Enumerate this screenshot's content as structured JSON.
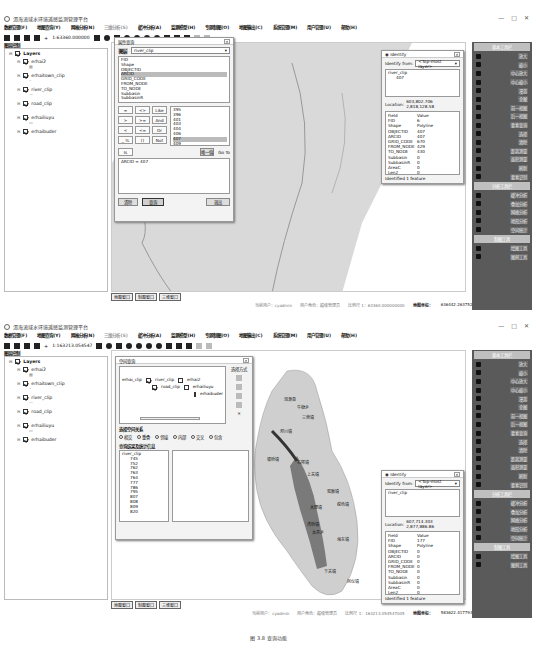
{
  "app_title": "洱海流域水环境遥感监测管理平台",
  "window_controls": [
    "—",
    "□",
    "✕"
  ],
  "menu": [
    "数据管理(F)",
    "地图查询(Y)",
    "网格分析(N)",
    "三维分析(S)",
    "缓冲分析(A)",
    "监测模型(H)",
    "专题制图(O)",
    "地图输出(C)",
    "系统管理(M)",
    "用户管理(U)",
    "帮助(H)"
  ],
  "screens": [
    {
      "scale": "1:63360.000000",
      "layer_panel_title": "图层控制",
      "layers_root": "Layers",
      "layers": [
        "erhai2",
        "erhaitown_clip",
        "river_clip",
        "road_clip",
        "erhailiuyu",
        "erhaibuder"
      ],
      "map_tabs": [
        "地图窗口",
        "制图窗口",
        "三维窗口"
      ],
      "status": {
        "user": "当前用户：cyadmin",
        "role": "用户角色：超级管理员",
        "scale": "比例尺 1：63360.000000000",
        "coord_label": "地图坐标：",
        "x": "636442.26375267",
        "y": "2917443.26105774"
      },
      "query_dialog": {
        "title": "属性查询",
        "layer_label": "图层",
        "layer_value": "river_clip",
        "fields": [
          "FID",
          "Shape",
          "OBJECTID",
          "ARCID",
          "GRID_CODE",
          "FROM_NODE",
          "TO_NODE",
          "Subbasin",
          "SubbasinR"
        ],
        "selected_field": "ARCID",
        "operators": [
          [
            "=",
            "<>",
            "Like"
          ],
          [
            ">",
            ">=",
            "And"
          ],
          [
            "<",
            "<=",
            "Or"
          ],
          [
            "_ %",
            "()",
            "Not"
          ]
        ],
        "values": [
          "395",
          "396",
          "401",
          "403",
          "404",
          "406",
          "407",
          "409",
          "411"
        ],
        "selected_value": "407",
        "is_label": "Is",
        "unique_btn": "唯一值",
        "goto_label": "Go To",
        "expression": "ARCID = 407",
        "clear_btn": "清除",
        "query_btn": "查询",
        "close_btn": "退出"
      },
      "identify": {
        "title": "Identify",
        "from_label": "Identify from:",
        "from_value": "<Top-most layer>",
        "tree_layer": "river_clip",
        "tree_value": "407",
        "location_label": "Location:",
        "location": "603,802.706  2,818,128.58",
        "header": [
          "Field",
          "Value"
        ],
        "rows": [
          [
            "FID",
            "6"
          ],
          [
            "Shape",
            "Polyline"
          ],
          [
            "OBJECTID",
            "407"
          ],
          [
            "ARCID",
            "407"
          ],
          [
            "GRID_CODE",
            "670"
          ],
          [
            "FROM_NODE",
            "429"
          ],
          [
            "TO_NODE",
            "430"
          ],
          [
            "Subbasin",
            "0"
          ],
          [
            "SubbasinR",
            "0"
          ],
          [
            "AreaC",
            "0"
          ],
          [
            "Len2",
            "0"
          ],
          [
            "Shape_Leng",
            "3242.448838"
          ]
        ],
        "footer": "Identified 1 feature"
      }
    },
    {
      "scale": "1:163213.054547",
      "layer_panel_title": "图层控制",
      "layers_root": "Layers",
      "layers": [
        "erhai2",
        "erhaitown_clip",
        "river_clip",
        "road_clip",
        "erhailiuyu",
        "erhaibuder"
      ],
      "map_tabs": [
        "地图窗口",
        "制图窗口",
        "三维窗口"
      ],
      "status": {
        "user": "当前用户：cyadmin",
        "role": "用户角色：超级管理员",
        "scale": "比例尺 1：163213.054547005",
        "coord_label": "地图坐标：",
        "x": "583622.41779353",
        "y": "2886538.28433817"
      },
      "spatial_dialog": {
        "title": "空间查询",
        "source_layer": "erhai_clip",
        "target_layers": [
          "river_clip",
          "road_clip"
        ],
        "other_layers": [
          "erhai2",
          "erhailiuyu",
          "erhaibuder"
        ],
        "method_label": "选择方式",
        "relation_label": "选择空间关系",
        "relations": [
          "相交",
          "重叠",
          "邻接",
          "内部",
          "交叉",
          "包含"
        ],
        "selected_relation": "相交",
        "result_label": "查询结果及统计信息",
        "result_layer": "river_clip",
        "result_ids": [
          "745",
          "752",
          "762",
          "763",
          "764",
          "777",
          "786",
          "795",
          "807",
          "808",
          "809",
          "820"
        ]
      },
      "identify": {
        "title": "Identify",
        "from_label": "Identify from:",
        "from_value": "<Top-most layer>",
        "tree_layer": "river_clip",
        "tree_value": "",
        "location_label": "Location:",
        "location": "607,714.303  2,877,886.86",
        "header": [
          "Field",
          "Value"
        ],
        "rows": [
          [
            "FID",
            "177"
          ],
          [
            "Shape",
            "Polyline"
          ],
          [
            "OBJECTID",
            "0"
          ],
          [
            "ARCID",
            "0"
          ],
          [
            "GRID_CODE",
            "0"
          ],
          [
            "FROM_NODE",
            "0"
          ],
          [
            "TO_NODE",
            "0"
          ],
          [
            "Subbasin",
            "0"
          ],
          [
            "SubbasinR",
            "0"
          ],
          [
            "AreaC",
            "0"
          ],
          [
            "Len2",
            "0"
          ],
          [
            "Shape_Leng",
            "0"
          ]
        ],
        "footer": "Identified 1 feature"
      },
      "map_labels": [
        "洱源县",
        "牛街乡",
        "三营镇",
        "邓川镇",
        "右所镇",
        "上关镇",
        "双廊镇",
        "挖色镇",
        "大理镇",
        "银桥镇",
        "湾桥镇",
        "海东镇",
        "下关镇",
        "凤仪镇",
        "太邑乡"
      ]
    }
  ],
  "dock": {
    "sections": [
      {
        "title": "基本工具栏",
        "items": [
          "放大",
          "缩小",
          "中心放大",
          "中心缩小",
          "漫游",
          "全图",
          "前一视图",
          "后一视图",
          "要素查询",
          "选择",
          "清除",
          "距离测量",
          "面积测量",
          "刷新",
          "要素识别"
        ]
      },
      {
        "title": "分析工具栏",
        "items": [
          "缓冲分析",
          "叠加分析",
          "网络分析",
          "地形分析",
          "空间统计"
        ]
      },
      {
        "title": "制图工具",
        "items": [
          "绘图工具",
          "图例工具"
        ]
      }
    ]
  },
  "caption": "图 3.8  查询功能"
}
